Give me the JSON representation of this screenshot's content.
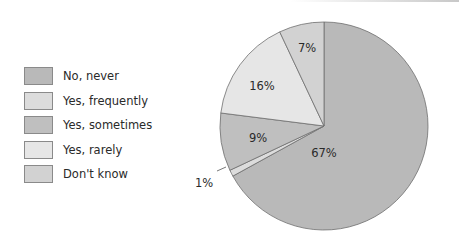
{
  "chart_data": {
    "type": "pie",
    "title": "",
    "categories": [
      "No, never",
      "Yes, frequently",
      "Yes, sometimes",
      "Yes, rarely",
      "Don't know"
    ],
    "slices": [
      {
        "label": "No, never",
        "value": 67,
        "display": "67%",
        "color": "#b9b9b9"
      },
      {
        "label": "Yes, frequently",
        "value": 1,
        "display": "1%",
        "color": "#dcdcdc"
      },
      {
        "label": "Yes, sometimes",
        "value": 9,
        "display": "9%",
        "color": "#bfbfbf"
      },
      {
        "label": "Yes, rarely",
        "value": 16,
        "display": "16%",
        "color": "#e6e6e6"
      },
      {
        "label": "Don't know",
        "value": 7,
        "display": "7%",
        "color": "#d2d2d2"
      }
    ],
    "legend_position": "left",
    "start_angle_deg": 0,
    "direction": "clockwise"
  },
  "legend": {
    "items": [
      {
        "label": "No, never",
        "color": "#b9b9b9"
      },
      {
        "label": "Yes, frequently",
        "color": "#dcdcdc"
      },
      {
        "label": "Yes, sometimes",
        "color": "#bfbfbf"
      },
      {
        "label": "Yes, rarely",
        "color": "#e6e6e6"
      },
      {
        "label": "Don't know",
        "color": "#d2d2d2"
      }
    ]
  },
  "labels": {
    "never": "67%",
    "frequently": "1%",
    "sometimes": "9%",
    "rarely": "16%",
    "dontknow": "7%"
  }
}
